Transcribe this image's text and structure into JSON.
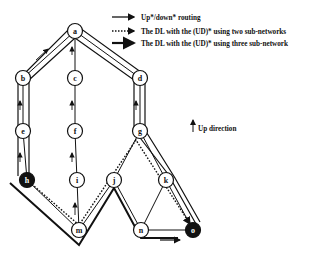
{
  "legend": {
    "items": [
      {
        "style": "solid-arrow",
        "label": "Up*/down* routing"
      },
      {
        "style": "dotted-arrow",
        "label": "The DL with the (UD)* using two sub-networks"
      },
      {
        "style": "double-arrow",
        "label": "The DL with the (UD)* using three sub-network"
      }
    ],
    "up_direction_label": "Up direction"
  },
  "nodes": [
    {
      "id": "a",
      "x": 75,
      "y": 31,
      "filled": false
    },
    {
      "id": "b",
      "x": 23,
      "y": 78,
      "filled": false
    },
    {
      "id": "c",
      "x": 75,
      "y": 78,
      "filled": false
    },
    {
      "id": "d",
      "x": 140,
      "y": 78,
      "filled": false
    },
    {
      "id": "e",
      "x": 23,
      "y": 131,
      "filled": false
    },
    {
      "id": "f",
      "x": 75,
      "y": 131,
      "filled": false
    },
    {
      "id": "g",
      "x": 140,
      "y": 131,
      "filled": false
    },
    {
      "id": "h",
      "x": 27,
      "y": 180,
      "filled": true
    },
    {
      "id": "i",
      "x": 77,
      "y": 180,
      "filled": false
    },
    {
      "id": "j",
      "x": 114,
      "y": 180,
      "filled": false
    },
    {
      "id": "k",
      "x": 166,
      "y": 180,
      "filled": false
    },
    {
      "id": "m",
      "x": 79,
      "y": 230,
      "filled": false
    },
    {
      "id": "n",
      "x": 141,
      "y": 230,
      "filled": false
    },
    {
      "id": "o",
      "x": 193,
      "y": 230,
      "filled": true
    }
  ]
}
